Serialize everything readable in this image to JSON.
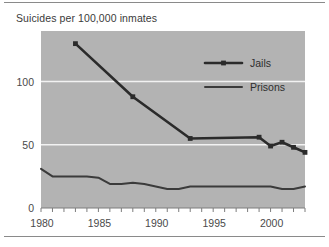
{
  "chart_data": {
    "type": "line",
    "title": "Suicides per 100,000 inmates",
    "xlabel": "",
    "ylabel": "",
    "xlim": [
      1980,
      2003
    ],
    "ylim": [
      0,
      140
    ],
    "yticks": [
      0,
      50,
      100
    ],
    "ytick_labels": [
      "0",
      "50",
      "100"
    ],
    "xticks": [
      1980,
      1981,
      1982,
      1983,
      1984,
      1985,
      1986,
      1987,
      1988,
      1989,
      1990,
      1991,
      1992,
      1993,
      1994,
      1995,
      1996,
      1997,
      1998,
      1999,
      2000,
      2001,
      2002,
      2003
    ],
    "xtick_labels": [
      "1980",
      "1985",
      "1990",
      "1995",
      "2000"
    ],
    "labeled_xticks": [
      1980,
      1985,
      1990,
      1995,
      2000
    ],
    "grid": "horizontal-white-gridlines",
    "plot_background": "#b3b3b3",
    "legend_position": "upper-right-inside",
    "series": [
      {
        "name": "Jails",
        "marker": "filled-square",
        "color": "#2b2b2b",
        "x": [
          1983,
          1988,
          1993,
          1999,
          2000,
          2001,
          2002,
          2003
        ],
        "values": [
          130,
          88,
          55,
          56,
          49,
          52,
          48,
          44
        ]
      },
      {
        "name": "Prisons",
        "marker": "none",
        "color": "#3b3b3b",
        "x": [
          1980,
          1981,
          1982,
          1983,
          1984,
          1985,
          1986,
          1987,
          1988,
          1989,
          1990,
          1991,
          1992,
          1993,
          1994,
          1995,
          1996,
          1997,
          1998,
          1999,
          2000,
          2001,
          2002,
          2003
        ],
        "values": [
          31,
          25,
          25,
          25,
          25,
          24,
          19,
          19,
          20,
          19,
          17,
          15,
          15,
          17,
          17,
          17,
          17,
          17,
          17,
          17,
          17,
          15,
          15,
          17
        ]
      }
    ]
  },
  "legend": {
    "items": [
      {
        "label": "Jails"
      },
      {
        "label": "Prisons"
      }
    ]
  }
}
